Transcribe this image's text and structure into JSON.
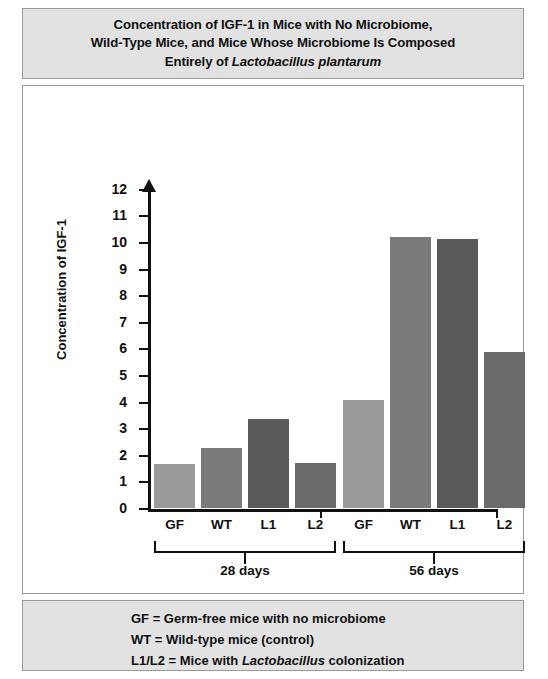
{
  "title": {
    "line1": "Concentration of IGF-1 in Mice with No Microbiome,",
    "line2": "Wild-Type Mice, and Mice Whose Microbiome Is Composed",
    "line3_prefix": "Entirely of ",
    "line3_italic": "Lactobacillus plantarum"
  },
  "legend": {
    "line1": "GF = Germ-free mice with no microbiome",
    "line2": "WT = Wild-type mice (control)",
    "line3_prefix": "L1/L2 = Mice with ",
    "line3_italic": "Lactobacillus",
    "line3_suffix": " colonization"
  },
  "colors": {
    "bar_gf": "#9a9a9a",
    "bar_wt": "#7a7a7a",
    "bar_l1": "#5a5a5a",
    "bar_l2": "#6a6a6a",
    "axis": "#111111",
    "band_background": "#e2e2e2",
    "band_border": "#9a9a9a",
    "plot_background": "#ffffff"
  },
  "chart_data": {
    "type": "bar",
    "title": "Concentration of IGF-1 in Mice with No Microbiome, Wild-Type Mice, and Mice Whose Microbiome Is Composed Entirely of Lactobacillus plantarum",
    "xlabel": "",
    "ylabel": "Concentration of IGF-1",
    "ylim": [
      0,
      12
    ],
    "ytick_labels": [
      "12",
      "11",
      "10",
      "9",
      "8",
      "7",
      "6",
      "5",
      "4",
      "3",
      "2",
      "1",
      "0"
    ],
    "ytick_values": [
      12,
      11,
      10,
      9,
      8,
      7,
      6,
      5,
      4,
      3,
      2,
      1,
      0
    ],
    "grid": false,
    "legend_position": "below-plot",
    "groups": [
      {
        "label": "28 days",
        "categories": [
          "GF",
          "WT",
          "L1",
          "L2"
        ],
        "values": [
          1.65,
          2.25,
          3.35,
          1.7
        ]
      },
      {
        "label": "56 days",
        "categories": [
          "GF",
          "WT",
          "L1",
          "L2"
        ],
        "values": [
          4.05,
          10.2,
          10.1,
          5.85
        ]
      }
    ],
    "categories": [
      "GF",
      "WT",
      "L1",
      "L2",
      "GF",
      "WT",
      "L1",
      "L2"
    ],
    "values": [
      1.65,
      2.25,
      3.35,
      1.7,
      4.05,
      10.2,
      10.1,
      5.85
    ]
  },
  "geometry": {
    "y_zero_px": 423,
    "px_per_unit": 26.6,
    "bar_width": 41,
    "bar_gap": 6,
    "group1_left": 131,
    "group2_left": 320
  }
}
